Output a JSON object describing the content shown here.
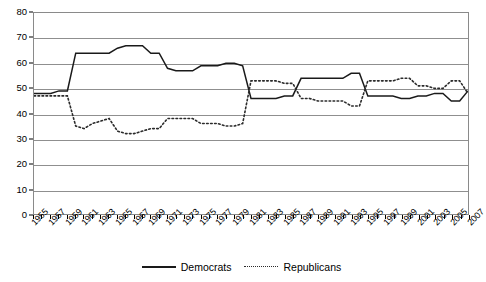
{
  "chart_data": {
    "type": "line",
    "title": "",
    "xlabel": "",
    "ylabel": "",
    "ylim": [
      0,
      80
    ],
    "ytick_step": 10,
    "grid": true,
    "legend_position": "bottom",
    "x": [
      1955,
      1956,
      1957,
      1958,
      1959,
      1960,
      1961,
      1962,
      1963,
      1964,
      1965,
      1966,
      1967,
      1968,
      1969,
      1970,
      1971,
      1972,
      1973,
      1974,
      1975,
      1976,
      1977,
      1978,
      1979,
      1980,
      1981,
      1982,
      1983,
      1984,
      1985,
      1986,
      1987,
      1988,
      1989,
      1990,
      1991,
      1992,
      1993,
      1994,
      1995,
      1996,
      1997,
      1998,
      1999,
      2000,
      2001,
      2002,
      2003,
      2004,
      2005,
      2006,
      2007
    ],
    "xtick_labels": [
      "1955",
      "1957",
      "1959",
      "1961",
      "1963",
      "1965",
      "1967",
      "1969",
      "1971",
      "1973",
      "1975",
      "1977",
      "1979",
      "1981",
      "1983",
      "1985",
      "1987",
      "1989",
      "1991",
      "1993",
      "1995",
      "1997",
      "1999",
      "2001",
      "2003",
      "2005",
      "2007"
    ],
    "yticks": [
      0,
      10,
      20,
      30,
      40,
      50,
      60,
      70,
      80
    ],
    "series": [
      {
        "name": "Democrats",
        "style": "solid",
        "color": "#1a1a1a",
        "values": [
          48,
          48,
          48,
          49,
          49,
          64,
          64,
          64,
          64,
          64,
          66,
          67,
          67,
          67,
          64,
          64,
          58,
          57,
          57,
          57,
          59,
          59,
          59,
          60,
          60,
          59,
          46,
          46,
          46,
          46,
          47,
          47,
          54,
          54,
          54,
          54,
          54,
          54,
          56,
          56,
          47,
          47,
          47,
          47,
          46,
          46,
          47,
          47,
          48,
          48,
          45,
          45,
          49
        ]
      },
      {
        "name": "Republicans",
        "style": "dotted",
        "color": "#2b2b2b",
        "values": [
          47,
          47,
          47,
          47,
          47,
          35,
          34,
          36,
          37,
          38,
          33,
          32,
          32,
          33,
          34,
          34,
          38,
          38,
          38,
          38,
          36,
          36,
          36,
          35,
          35,
          36,
          53,
          53,
          53,
          53,
          52,
          52,
          46,
          46,
          45,
          45,
          45,
          45,
          43,
          43,
          53,
          53,
          53,
          53,
          54,
          54,
          51,
          51,
          50,
          50,
          53,
          53,
          48
        ]
      }
    ]
  },
  "legend": {
    "entries": [
      {
        "label": "Democrats",
        "style": "solid"
      },
      {
        "label": "Republicans",
        "style": "dotted"
      }
    ]
  }
}
